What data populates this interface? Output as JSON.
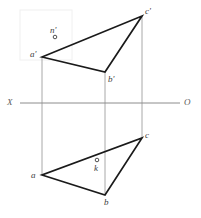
{
  "figure": {
    "type": "descriptive-geometry-orthographic-projection",
    "background_color": "#ffffff",
    "line_color": "#1a1a1a",
    "projection_line_color": "#a8a8a8",
    "axis_color": "#8c8c8c",
    "label_color": "#3c3c3c",
    "watermark_color": "#f0f0f0"
  },
  "axis": {
    "left_label": "X",
    "right_label": "O",
    "y": 103,
    "x_start": 20,
    "x_end": 180,
    "left_label_x": 7,
    "right_label_x": 184
  },
  "vertices": {
    "frontal": [
      {
        "id": "a-prime",
        "label": "a'",
        "x": 42,
        "y": 57,
        "label_x": 30,
        "label_y": 50
      },
      {
        "id": "b-prime",
        "label": "b'",
        "x": 105,
        "y": 72,
        "label_x": 108,
        "label_y": 75
      },
      {
        "id": "c-prime",
        "label": "c'",
        "x": 142,
        "y": 16,
        "label_x": 145,
        "label_y": 7
      }
    ],
    "horizontal": [
      {
        "id": "a",
        "label": "a",
        "x": 42,
        "y": 175,
        "label_x": 31,
        "label_y": 171
      },
      {
        "id": "b",
        "label": "b",
        "x": 105,
        "y": 195,
        "label_x": 104,
        "label_y": 198
      },
      {
        "id": "c",
        "label": "c",
        "x": 142,
        "y": 138,
        "label_x": 145,
        "label_y": 131
      }
    ]
  },
  "points": [
    {
      "id": "n-prime",
      "label": "n'",
      "marker_x": 55,
      "marker_y": 37,
      "label_x": 50,
      "label_y": 26,
      "radius": 1.8
    },
    {
      "id": "k",
      "label": "k",
      "marker_x": 97,
      "marker_y": 160,
      "label_x": 94,
      "label_y": 164,
      "radius": 1.8
    }
  ],
  "projection_lines": [
    {
      "id": "proj-a",
      "x": 42,
      "y1": 57,
      "y2": 175
    },
    {
      "id": "proj-b",
      "x": 105,
      "y1": 72,
      "y2": 195
    },
    {
      "id": "proj-c",
      "x": 142,
      "y1": 16,
      "y2": 138
    }
  ],
  "watermark": {
    "x": 20,
    "y": 10,
    "width": 52,
    "height": 50
  }
}
